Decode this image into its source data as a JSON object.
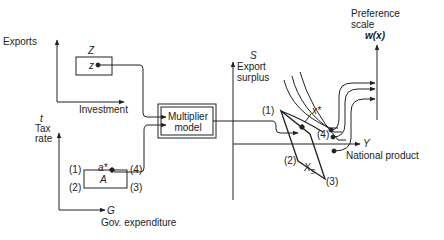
{
  "diagram": {
    "top_left_panel": {
      "y_axis_label": "Exports",
      "x_axis_label": "Investment",
      "box_label": "Z",
      "point_label": "z"
    },
    "bottom_left_panel": {
      "y_axis_symbol": "t",
      "y_axis_label_line1": "Tax",
      "y_axis_label_line2": "rate",
      "x_axis_symbol": "G",
      "x_axis_label": "Gov. expenditure",
      "box_label": "A",
      "point_label": "a*",
      "corners": [
        "(1)",
        "(2)",
        "(3)",
        "(4)"
      ]
    },
    "center_block": {
      "line1": "Multiplier",
      "line2": "model"
    },
    "right_panel": {
      "y_axis_symbol": "S",
      "y_axis_label_line1": "Export",
      "y_axis_label_line2": "surplus",
      "x_axis_symbol": "Y",
      "x_axis_label": "National product",
      "region_label": "X",
      "region_subscript": "s",
      "point_label": "x*",
      "corners": [
        "(1)",
        "(2)",
        "(3)",
        "(4)"
      ]
    },
    "preference_axis": {
      "label_line1": "Preference",
      "label_line2": "scale",
      "function_label": "w(x)"
    }
  }
}
